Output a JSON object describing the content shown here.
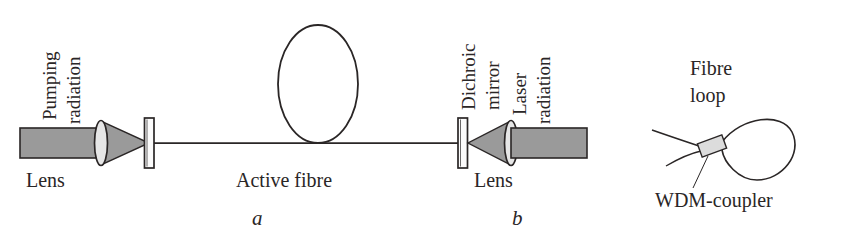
{
  "figure": {
    "type": "optical-schematic",
    "background_color": "#ffffff",
    "line_color": "#2a2626",
    "beam_fill_color": "#9a9a9a",
    "coupler_fill_color": "#d9d9d9"
  },
  "labels": {
    "pumping_radiation": "Pumping\nradiation",
    "pumping_radiation_line1": "Pumping",
    "pumping_radiation_line2": "radiation",
    "lens_left": "Lens",
    "active_fibre": "Active fibre",
    "dichroic_mirror_line1": "Dichroic",
    "dichroic_mirror_line2": "mirror",
    "laser_radiation_line1": "Laser",
    "laser_radiation_line2": "radiation",
    "lens_right": "Lens",
    "subfigure_a": "a",
    "subfigure_b": "b",
    "fibre_loop_line1": "Fibre",
    "fibre_loop_line2": "loop",
    "wdm_coupler": "WDM-coupler"
  },
  "components": {
    "pump_beam": {
      "x": 20,
      "y": 128,
      "width": 76,
      "height": 30
    },
    "lens_left": {
      "cx": 101,
      "cy": 143,
      "rx": 6,
      "ry": 22
    },
    "cone_left": {
      "points": "101,121 101,165 148,143"
    },
    "mirror_left": {
      "x": 144,
      "y": 118,
      "width": 10,
      "height": 50
    },
    "cavity_axis": {
      "x1": 154,
      "y1": 143,
      "x2": 460,
      "y2": 143
    },
    "fibre_loop": {
      "cx": 318,
      "cy": 84,
      "rx": 40,
      "ry": 59
    },
    "mirror_right": {
      "x": 458,
      "y": 118,
      "width": 10,
      "height": 50
    },
    "cone_right": {
      "points": "511,121 511,165 468,143"
    },
    "lens_right": {
      "cx": 511,
      "cy": 143,
      "rx": 6,
      "ry": 22
    },
    "laser_beam": {
      "x": 511,
      "y": 128,
      "width": 76,
      "height": 30
    },
    "detail_loop_coupler": {
      "cx": 712,
      "cy": 145,
      "width": 26,
      "height": 15,
      "rotation": -20
    }
  }
}
